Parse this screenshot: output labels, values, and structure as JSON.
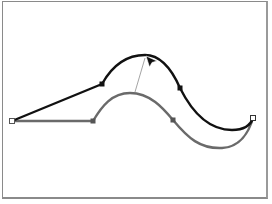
{
  "figure": {
    "colors": {
      "background": "#ffffff",
      "frame": "#8a8a8a",
      "original_path": "#6a6a6a",
      "edited_path": "#111111",
      "drag_guide": "#9a9a9a",
      "cursor": "#111111"
    },
    "original_path": {
      "label": "original-curve",
      "start_anchor": {
        "x": 12,
        "y": 121,
        "style": "hollow"
      },
      "anchors": [
        {
          "x": 93,
          "y": 121,
          "style": "filled"
        },
        {
          "x": 173,
          "y": 120,
          "style": "filled"
        }
      ]
    },
    "edited_path": {
      "label": "edited-curve",
      "start_anchor": {
        "x": 12,
        "y": 121,
        "style": "hollow"
      },
      "anchors": [
        {
          "x": 102,
          "y": 84,
          "style": "filled"
        },
        {
          "x": 180,
          "y": 88,
          "style": "filled"
        }
      ],
      "end_anchor": {
        "x": 253,
        "y": 118,
        "style": "hollow"
      }
    },
    "drag_guide": {
      "x1": 135,
      "y1": 92,
      "x2": 145,
      "y2": 58
    },
    "cursor": {
      "x": 146,
      "y": 56,
      "type": "arrow"
    }
  }
}
